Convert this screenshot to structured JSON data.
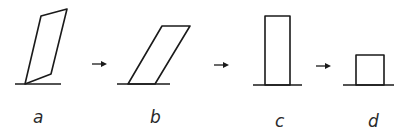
{
  "diagram": {
    "stroke_color": "#1a1a1a",
    "background": "#ffffff",
    "panels": [
      {
        "id": "a",
        "label": "a",
        "shape": "parallelogram-tilted",
        "baseline": {
          "x1": 15,
          "x2": 61,
          "y": 84
        },
        "points": "25,84 51,74 67,9 41,16",
        "label_pos": {
          "x": 33,
          "y": 123
        }
      },
      {
        "id": "b",
        "label": "b",
        "shape": "parallelogram-sheared",
        "baseline": {
          "x1": 117,
          "x2": 170,
          "y": 84
        },
        "points": "128,84 155,84 190,26 162,26",
        "label_pos": {
          "x": 150,
          "y": 123
        }
      },
      {
        "id": "c",
        "label": "c",
        "shape": "tall-rectangle",
        "baseline": {
          "x1": 253,
          "x2": 302,
          "y": 85
        },
        "points": "265,85 265,16 290,16 290,85",
        "label_pos": {
          "x": 275,
          "y": 127
        }
      },
      {
        "id": "d",
        "label": "d",
        "shape": "square",
        "baseline": {
          "x1": 343,
          "x2": 394,
          "y": 85
        },
        "points": "356,85 356,55 384,55 384,85",
        "label_pos": {
          "x": 368,
          "y": 127
        }
      }
    ],
    "arrows": [
      {
        "from": "a",
        "to": "b",
        "symbol": "→",
        "x1": 92,
        "x2": 106,
        "y": 64
      },
      {
        "from": "b",
        "to": "c",
        "symbol": "→",
        "x1": 214,
        "x2": 228,
        "y": 65
      },
      {
        "from": "c",
        "to": "d",
        "symbol": "→",
        "x1": 316,
        "x2": 330,
        "y": 66
      }
    ]
  }
}
